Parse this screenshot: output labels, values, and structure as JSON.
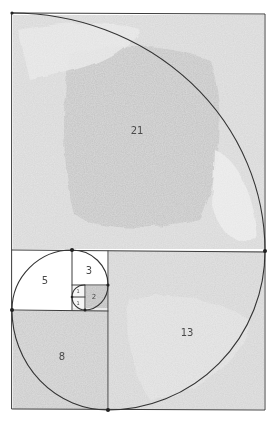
{
  "diagram": {
    "type": "fibonacci-spiral-golden-rectangle",
    "style": "hand-drawn pencil with watercolor shading",
    "colors": {
      "paper": "#ffffff",
      "wash_dark": "#c8c8c8",
      "wash_mid": "#d9d9d9",
      "wash_light": "#e6e6e6",
      "wash_square2": "#bdbdbd",
      "line": "#3a3a3a"
    },
    "squares": [
      {
        "label": "21",
        "side": 21,
        "shaded": true
      },
      {
        "label": "13",
        "side": 13,
        "shaded": true
      },
      {
        "label": "8",
        "side": 8,
        "shaded": true
      },
      {
        "label": "5",
        "side": 5,
        "shaded": false
      },
      {
        "label": "3",
        "side": 3,
        "shaded": false
      },
      {
        "label": "2",
        "side": 2,
        "shaded": true
      },
      {
        "label": "1",
        "side": 1,
        "shaded": false
      },
      {
        "label": "1",
        "side": 1,
        "shaded": false
      }
    ]
  }
}
